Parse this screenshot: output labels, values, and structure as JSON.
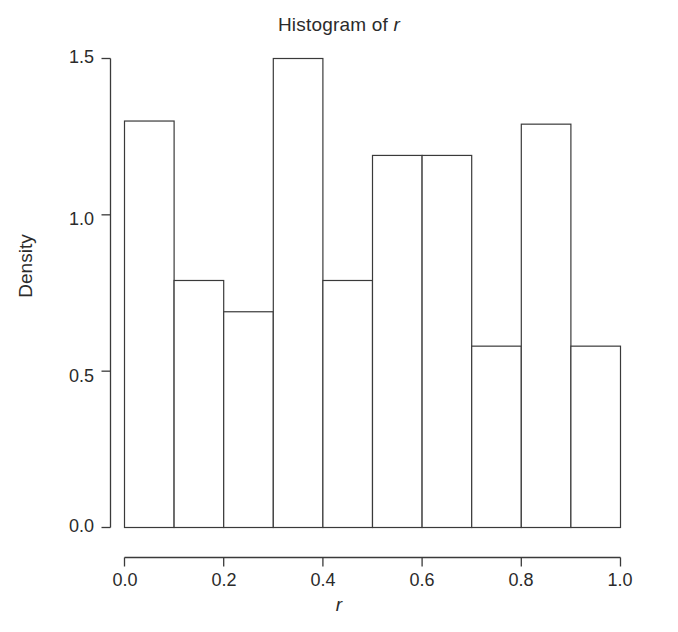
{
  "chart_data": {
    "type": "bar",
    "title": "Histogram of r",
    "title_prefix": "Histogram of ",
    "title_variable": "r",
    "xlabel": "r",
    "ylabel": "Density",
    "grid": false,
    "legend": false,
    "bin_width": 0.1,
    "bin_edges": [
      0.0,
      0.1,
      0.2,
      0.3,
      0.4,
      0.5,
      0.6,
      0.7,
      0.8,
      0.9,
      1.0
    ],
    "categories": [
      "0.0-0.1",
      "0.1-0.2",
      "0.2-0.3",
      "0.3-0.4",
      "0.4-0.5",
      "0.5-0.6",
      "0.6-0.7",
      "0.7-0.8",
      "0.8-0.9",
      "0.9-1.0"
    ],
    "values": [
      1.3,
      0.79,
      0.69,
      1.5,
      0.79,
      1.19,
      1.19,
      0.58,
      1.29,
      0.58
    ],
    "xlim": [
      0.0,
      1.0
    ],
    "ylim": [
      0.0,
      1.5
    ],
    "xticks": [
      "0.0",
      "0.2",
      "0.4",
      "0.6",
      "0.8",
      "1.0"
    ],
    "xtick_values": [
      0.0,
      0.2,
      0.4,
      0.6,
      0.8,
      1.0
    ],
    "yticks": [
      "0.0",
      "0.5",
      "1.0",
      "1.5"
    ],
    "ytick_values": [
      0.0,
      0.5,
      1.0,
      1.5
    ],
    "bar_fill": "#ffffff",
    "bar_stroke": "#3a3a3a",
    "axis_color": "#3a3a3a",
    "background": "#ffffff"
  }
}
